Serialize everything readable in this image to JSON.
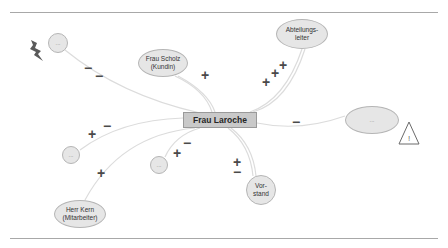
{
  "diagram": {
    "type": "stakeholder-map",
    "center": {
      "label": "Frau Laroche"
    },
    "nodes": [
      {
        "id": "unknown-top-left",
        "label": "...",
        "relation": [
          "−",
          "−"
        ]
      },
      {
        "id": "frau-scholz",
        "label_line1": "Frau Scholz",
        "label_line2": "(Kundin)",
        "relation": [
          "+"
        ]
      },
      {
        "id": "abteilungsleiter",
        "label_line1": "Abteilungs-",
        "label_line2": "leiter",
        "relation": [
          "+",
          "+",
          "+"
        ]
      },
      {
        "id": "unknown-right",
        "label": "...",
        "relation": [
          "−"
        ]
      },
      {
        "id": "unknown-left",
        "label": "...",
        "relation": [
          "+",
          "−"
        ]
      },
      {
        "id": "herr-kern",
        "label_line1": "Herr Kern",
        "label_line2": "(Mitarbeiter)",
        "relation": [
          "+"
        ]
      },
      {
        "id": "unknown-bottom",
        "label": "...",
        "relation": [
          "+",
          "−"
        ]
      },
      {
        "id": "vorstand",
        "label_line1": "Vor-",
        "label_line2": "stand",
        "relation": [
          "+",
          "−"
        ]
      }
    ],
    "icons": {
      "lightning": "lightning-icon",
      "warning": "warning-triangle-icon",
      "warning_glyph": "!"
    },
    "signs": {
      "plus": "+",
      "minus": "−"
    },
    "colors": {
      "node_fill": "#e6e6e6",
      "node_border": "#b5b5b5",
      "center_fill": "#c9c9c9",
      "link": "#dcdcdc",
      "sign": "#4a4a4a",
      "rule": "#a8a8a8"
    }
  }
}
